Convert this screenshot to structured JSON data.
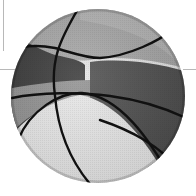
{
  "image": {
    "subject": "basketball",
    "style": "grayscale illustration",
    "colors": {
      "background": "#ffffff",
      "frame_lines": "#b8b8b8",
      "panel_light": "#e6e6e6",
      "panel_mid": "#a8a8a8",
      "panel_dark": "#4a4a4a",
      "panel_darkest": "#2e2e2e",
      "seam": "#111111"
    },
    "ball": {
      "cx": 98,
      "cy": 96,
      "r": 87
    }
  }
}
